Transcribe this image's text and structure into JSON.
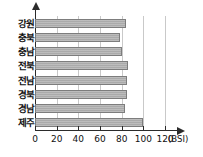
{
  "chart_data": {
    "type": "bar",
    "orientation": "horizontal",
    "title": "",
    "xlabel": "(BSI)",
    "ylabel": "",
    "categories": [
      "강원",
      "충북",
      "충남",
      "전북",
      "전남",
      "경북",
      "경남",
      "제주"
    ],
    "values": [
      84,
      78,
      80,
      86,
      85,
      85,
      83,
      100
    ],
    "xlim": [
      0,
      120
    ],
    "xticks": [
      0,
      20,
      40,
      60,
      80,
      100,
      120
    ],
    "xtick_labels": [
      "0",
      "20",
      "40",
      "60",
      "80",
      "100",
      "120"
    ],
    "gridlines": [
      20,
      40,
      60,
      80,
      100,
      120
    ],
    "grid": true,
    "legend": false,
    "bar_color": "#aaaaaa",
    "bar_border_color": "#7d7d7d",
    "axis_color": "#2b2b2b",
    "grid_color": "#c9c9c9",
    "unit": "(BSI)"
  }
}
